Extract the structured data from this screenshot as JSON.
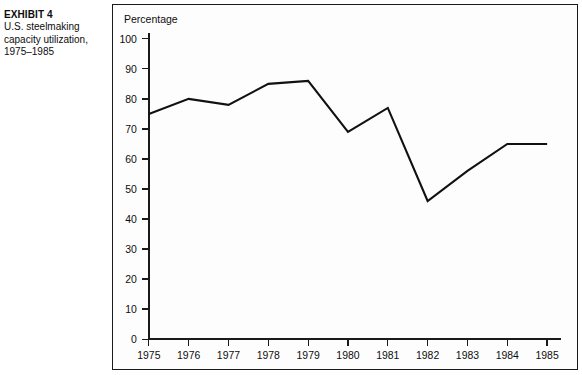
{
  "caption": {
    "exhibit_label": "EXHIBIT 4",
    "description": "U.S. steelmaking capacity utilization, 1975–1985"
  },
  "figure": {
    "axis_title": "Percentage",
    "border_color": "#1a1a1a",
    "line_color": "#111111",
    "background": "#fdfdfd"
  },
  "chart_data": {
    "type": "line",
    "title": "",
    "axis_title": "Percentage",
    "xlabel": "",
    "ylabel": "Percentage",
    "categories": [
      "1975",
      "1976",
      "1977",
      "1978",
      "1979",
      "1980",
      "1981",
      "1982",
      "1983",
      "1984",
      "1985"
    ],
    "x": [
      1975,
      1976,
      1977,
      1978,
      1979,
      1980,
      1981,
      1982,
      1983,
      1984,
      1985
    ],
    "values": [
      75,
      80,
      78,
      85,
      86,
      69,
      77,
      46,
      56,
      65,
      65
    ],
    "ylim": [
      0,
      100
    ],
    "ytick_labels": [
      "0",
      "10",
      "20",
      "30",
      "40",
      "50",
      "60",
      "70",
      "80",
      "90",
      "100"
    ],
    "yticks": [
      0,
      10,
      20,
      30,
      40,
      50,
      60,
      70,
      80,
      90,
      100
    ],
    "grid": false,
    "legend": false,
    "series": [
      {
        "name": "Capacity utilization",
        "values": [
          75,
          80,
          78,
          85,
          86,
          69,
          77,
          46,
          56,
          65,
          65
        ]
      }
    ]
  }
}
